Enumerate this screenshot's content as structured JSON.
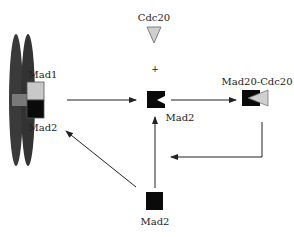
{
  "diagram": {
    "labels": {
      "mad1_chromosome": "Mad1",
      "mad2_chromosome": "Mad2",
      "cdc20": "Cdc20",
      "plus": "+",
      "mad2_open": "Mad2",
      "complex": "Mad20-Cdc20",
      "mad2_free": "Mad2"
    },
    "colors": {
      "chromosome": "#3a3a3a",
      "centromere": "#8a8a8a",
      "mad1": "#c8c8c8",
      "mad2": "#0a0a0a",
      "cdc20": "#cfcfcf",
      "arrow": "#222222"
    },
    "nodes": [
      {
        "id": "kinetochore",
        "name": "Mad1/Mad2 on chromosome"
      },
      {
        "id": "cdc20",
        "name": "Cdc20"
      },
      {
        "id": "mad2_open",
        "name": "Mad2 (open)"
      },
      {
        "id": "complex",
        "name": "Mad20-Cdc20"
      },
      {
        "id": "mad2_free",
        "name": "Mad2 (free)"
      }
    ],
    "edges": [
      {
        "from": "kinetochore",
        "to": "mad2_open"
      },
      {
        "from": "mad2_open",
        "to": "complex"
      },
      {
        "from": "complex",
        "to": "mad2_open"
      },
      {
        "from": "mad2_free",
        "to": "mad2_open"
      },
      {
        "from": "mad2_free",
        "to": "kinetochore"
      }
    ]
  }
}
